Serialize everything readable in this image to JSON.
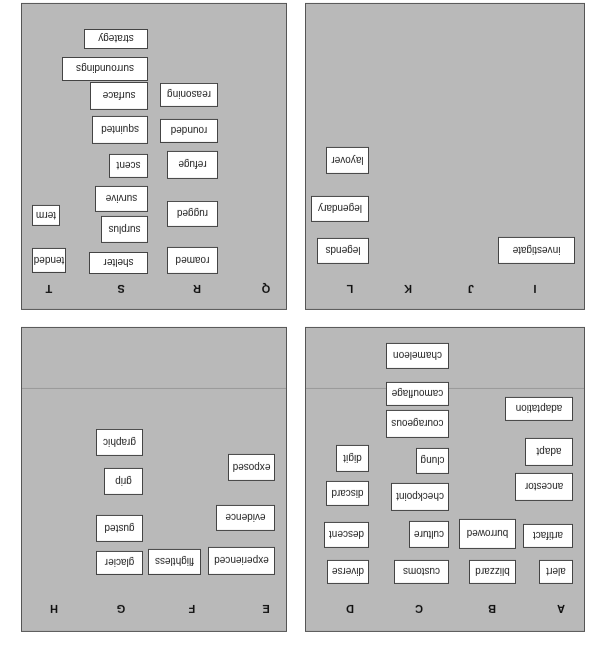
{
  "orientation": "rotated-180",
  "panels": [
    {
      "id": "abcd",
      "columns": [
        {
          "label": "A",
          "cards": [
            "alert",
            "artifact",
            "ancestor",
            "adapt",
            "adaptation"
          ]
        },
        {
          "label": "B",
          "cards": [
            "blizzard",
            "burrowed"
          ]
        },
        {
          "label": "C",
          "cards": [
            "customs",
            "culture",
            "checkpoint",
            "clung",
            "courageous",
            "camouflage",
            "chameleon"
          ]
        },
        {
          "label": "D",
          "cards": [
            "diverse",
            "descent",
            "discard",
            "digit"
          ]
        }
      ]
    },
    {
      "id": "efgh",
      "columns": [
        {
          "label": "E",
          "cards": [
            "experienced",
            "evidence",
            "exposed"
          ]
        },
        {
          "label": "F",
          "cards": [
            "flightless"
          ]
        },
        {
          "label": "G",
          "cards": [
            "glacier",
            "gusted",
            "grip",
            "graphic"
          ]
        },
        {
          "label": "H",
          "cards": []
        }
      ]
    },
    {
      "id": "ijkl",
      "columns": [
        {
          "label": "I",
          "cards": [
            "investigate"
          ]
        },
        {
          "label": "J",
          "cards": []
        },
        {
          "label": "K",
          "cards": []
        },
        {
          "label": "L",
          "cards": [
            "legends",
            "legendary",
            "layover"
          ]
        }
      ]
    },
    {
      "id": "qrst",
      "columns": [
        {
          "label": "Q",
          "cards": []
        },
        {
          "label": "R",
          "cards": [
            "roamed",
            "rugged",
            "refuge",
            "rounded",
            "reasoning"
          ]
        },
        {
          "label": "S",
          "cards": [
            "shelter",
            "surplus",
            "survive",
            "scent",
            "squinted",
            "surface",
            "surroundings",
            "strategy"
          ]
        },
        {
          "label": "T",
          "cards": [
            "tended",
            "term"
          ]
        }
      ]
    }
  ]
}
